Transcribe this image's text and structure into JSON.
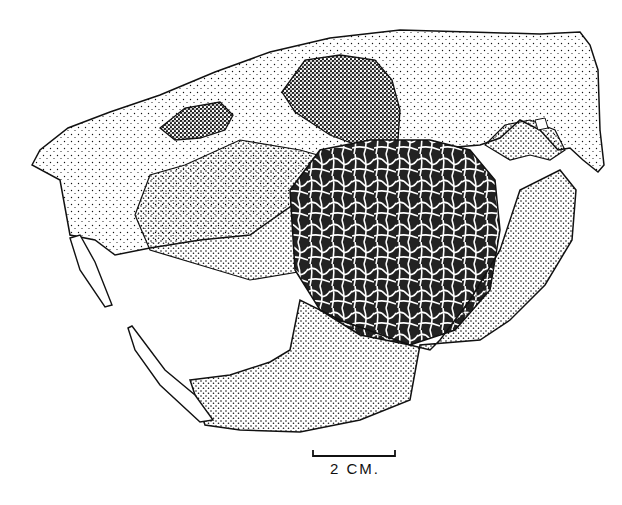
{
  "figure": {
    "background": "#ffffff",
    "ink_color": "#111111"
  },
  "scale_bar": {
    "label": "2 CM.",
    "length_px": 82
  }
}
